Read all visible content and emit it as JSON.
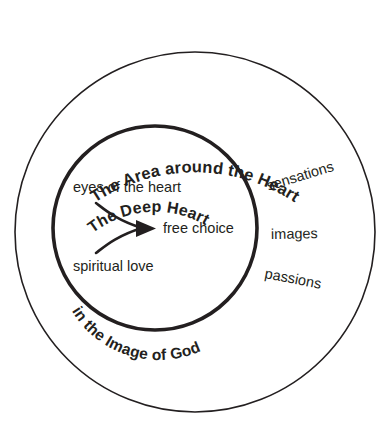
{
  "diagram": {
    "title": "The Area around the Heart",
    "type": "concentric-circles",
    "background_color": "#ffffff",
    "stroke_color": "#231f20",
    "rings": {
      "outer": {
        "label": "The Area around the Heart",
        "center_x": 195,
        "center_y": 232,
        "radius": 180,
        "stroke_width": 1.6
      },
      "inner": {
        "label": "The Deep Heart",
        "sublabel": "in the Image of God",
        "center_x": 155,
        "center_y": 228,
        "radius": 102,
        "stroke_width": 3.6
      }
    },
    "curved_labels": [
      {
        "text": "The Area around the Heart",
        "ring": "outer",
        "position": "top-arc"
      },
      {
        "text": "The Deep Heart",
        "ring": "inner",
        "position": "top-arc"
      },
      {
        "text": "in the Image of God",
        "ring": "inner",
        "position": "bottom-left-arc"
      }
    ],
    "inner_items": [
      {
        "text": "eyes of the heart",
        "role": "arrow-source-upper"
      },
      {
        "text": "spiritual love",
        "role": "arrow-source-lower"
      },
      {
        "text": "free choice",
        "role": "arrow-target"
      }
    ],
    "ring_items": [
      {
        "text": "sensations",
        "rotation_deg": -17
      },
      {
        "text": "images",
        "rotation_deg": -1
      },
      {
        "text": "passions",
        "rotation_deg": 11
      }
    ],
    "arrow": {
      "name": "converging-arrow",
      "description": "two curved tails merging into one arrowhead pointing right",
      "points_to": "free choice"
    }
  }
}
